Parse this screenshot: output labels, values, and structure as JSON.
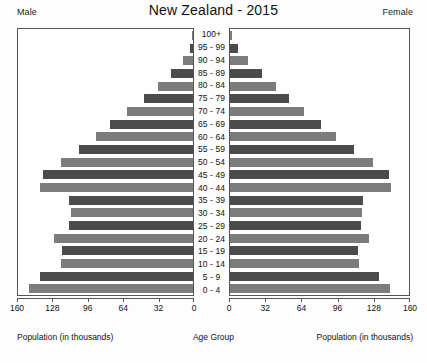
{
  "header": {
    "title": "New Zealand - 2015",
    "male_label": "Male",
    "female_label": "Female"
  },
  "axes": {
    "left_caption": "Population (in thousands)",
    "center_caption": "Age Group",
    "right_caption": "Population (in thousands)",
    "left_ticks": [
      "160",
      "128",
      "96",
      "64",
      "32",
      "0"
    ],
    "right_ticks": [
      "0",
      "32",
      "64",
      "96",
      "128",
      "160"
    ],
    "max": 160,
    "tick_step": 32
  },
  "colors": {
    "bar_dark": "#4b4b4b",
    "bar_light": "#7c7c7c",
    "frame": "#555555",
    "background": "#ffffff",
    "text": "#111111"
  },
  "chart_data": {
    "type": "bar",
    "subtype": "population-pyramid",
    "title": "New Zealand - 2015",
    "xlabel": "Population (in thousands)",
    "ylabel": "Age Group",
    "xlim": [
      0,
      160
    ],
    "xticks": [
      0,
      32,
      64,
      96,
      128,
      160
    ],
    "grid": false,
    "legend": [
      "Male",
      "Female"
    ],
    "legend_position": "top-corners",
    "units": "thousands",
    "categories": [
      "100+",
      "95 - 99",
      "90 - 94",
      "85 - 89",
      "80 - 84",
      "75 - 79",
      "70 - 74",
      "65 - 69",
      "60 - 64",
      "55 - 59",
      "50 - 54",
      "45 - 49",
      "40 - 44",
      "35 - 39",
      "30 - 34",
      "25 - 29",
      "20 - 24",
      "15 - 19",
      "10 - 14",
      "5 - 9",
      "0 - 4"
    ],
    "series": [
      {
        "name": "Male",
        "side": "left",
        "values": [
          1,
          3,
          9,
          20,
          32,
          45,
          60,
          76,
          89,
          104,
          121,
          137,
          140,
          113,
          112,
          113,
          127,
          120,
          121,
          140,
          150
        ]
      },
      {
        "name": "Female",
        "side": "right",
        "values": [
          2,
          7,
          16,
          29,
          41,
          53,
          66,
          81,
          95,
          111,
          128,
          142,
          144,
          119,
          118,
          117,
          124,
          114,
          115,
          133,
          143
        ]
      }
    ]
  }
}
